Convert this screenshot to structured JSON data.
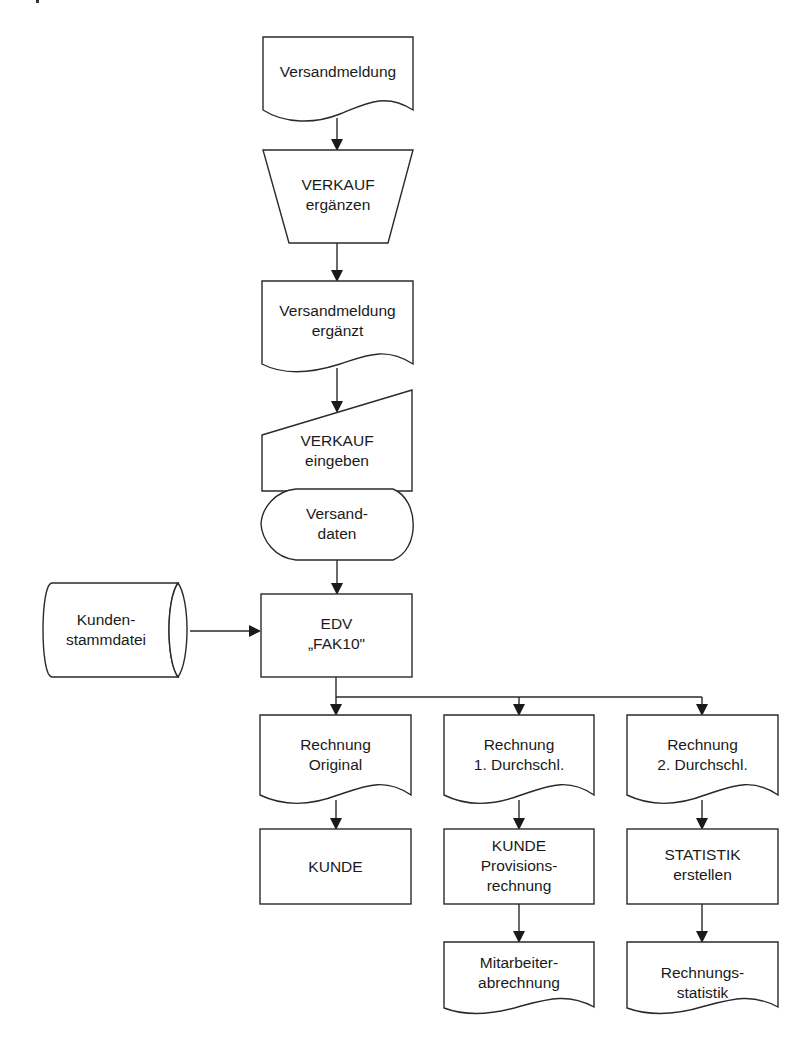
{
  "diagram": {
    "type": "flowchart",
    "nodes": {
      "versandmeldung": {
        "shape": "document",
        "lines": [
          "Versandmeldung"
        ]
      },
      "verkauf_ergaenzen": {
        "shape": "manual-operation",
        "lines": [
          "VERKAUF",
          "ergänzen"
        ]
      },
      "versandmeldung_ergaenzt": {
        "shape": "document",
        "lines": [
          "Versandmeldung",
          "ergänzt"
        ]
      },
      "verkauf_eingeben": {
        "shape": "manual-input",
        "lines": [
          "VERKAUF",
          "eingeben"
        ]
      },
      "versanddaten": {
        "shape": "display",
        "lines": [
          "Versand-",
          "daten"
        ]
      },
      "kundenstammdatei": {
        "shape": "stored-data",
        "lines": [
          "Kunden-",
          "stammdatei"
        ]
      },
      "edv_fak10": {
        "shape": "process",
        "lines": [
          "EDV",
          "„FAK10\""
        ]
      },
      "rechnung_original": {
        "shape": "document",
        "lines": [
          "Rechnung",
          "Original"
        ]
      },
      "rechnung_1": {
        "shape": "document",
        "lines": [
          "Rechnung",
          "1. Durchschl."
        ]
      },
      "rechnung_2": {
        "shape": "document",
        "lines": [
          "Rechnung",
          "2. Durchschl."
        ]
      },
      "kunde": {
        "shape": "process",
        "lines": [
          "KUNDE"
        ]
      },
      "kunde_provision": {
        "shape": "process",
        "lines": [
          "KUNDE",
          "Provisions-",
          "rechnung"
        ]
      },
      "statistik_erstellen": {
        "shape": "process",
        "lines": [
          "STATISTIK",
          "erstellen"
        ]
      },
      "mitarbeiterabrechnung": {
        "shape": "document",
        "lines": [
          "Mitarbeiter-",
          "abrechnung"
        ]
      },
      "rechnungsstatistik": {
        "shape": "document",
        "lines": [
          "Rechnungs-",
          "statistik"
        ]
      }
    },
    "edges": [
      [
        "versandmeldung",
        "verkauf_ergaenzen"
      ],
      [
        "verkauf_ergaenzen",
        "versandmeldung_ergaenzt"
      ],
      [
        "versandmeldung_ergaenzt",
        "verkauf_eingeben"
      ],
      [
        "versanddaten",
        "edv_fak10"
      ],
      [
        "kundenstammdatei",
        "edv_fak10"
      ],
      [
        "edv_fak10",
        "rechnung_original"
      ],
      [
        "edv_fak10",
        "rechnung_1"
      ],
      [
        "edv_fak10",
        "rechnung_2"
      ],
      [
        "rechnung_original",
        "kunde"
      ],
      [
        "rechnung_1",
        "kunde_provision"
      ],
      [
        "rechnung_2",
        "statistik_erstellen"
      ],
      [
        "kunde_provision",
        "mitarbeiterabrechnung"
      ],
      [
        "statistik_erstellen",
        "rechnungsstatistik"
      ]
    ],
    "colors": {
      "stroke": "#2a2a2a",
      "fill": "#ffffff",
      "text": "#1a1a1a"
    }
  }
}
